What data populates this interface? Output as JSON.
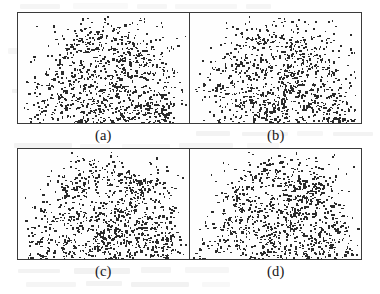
{
  "figure": {
    "kind": "four-panel-scatter-figure",
    "background_color": "#ffffff",
    "border_color": "#3a3a3a",
    "point_color": "#2b2b2b",
    "panels": [
      {
        "id": "panel-a",
        "caption": "(a)"
      },
      {
        "id": "panel-b",
        "caption": "(b)"
      },
      {
        "id": "panel-c",
        "caption": "(c)"
      },
      {
        "id": "panel-d",
        "caption": "(d)"
      }
    ],
    "captions": {
      "a": "(a)",
      "b": "(b)",
      "c": "(c)",
      "d": "(d)"
    }
  },
  "chart_data": {
    "type": "scatter",
    "title": "",
    "xlabel": "",
    "ylabel": "",
    "grid": false,
    "legend": null,
    "xlim": [
      0,
      1
    ],
    "ylim": [
      0,
      1
    ],
    "axis_ticks": {
      "x": [],
      "y": []
    },
    "panel_count": 4,
    "panel_layout": "2x2",
    "points_per_panel": 1100,
    "point_size_px": 1.3,
    "series": [
      {
        "name": "(a)",
        "n_points": 1100,
        "clusters": [
          {
            "cx": 0.17,
            "cy": 0.55,
            "sx": 0.085,
            "sy": 0.15,
            "n": 120,
            "label": "left sparse halo"
          },
          {
            "cx": 0.3,
            "cy": 0.42,
            "sx": 0.075,
            "sy": 0.17,
            "n": 130,
            "label": "left-mid band"
          },
          {
            "cx": 0.46,
            "cy": 0.55,
            "sx": 0.095,
            "sy": 0.2,
            "n": 230,
            "label": "dense core"
          },
          {
            "cx": 0.58,
            "cy": 0.7,
            "sx": 0.085,
            "sy": 0.15,
            "n": 180,
            "label": "lower-centre crowd"
          },
          {
            "cx": 0.62,
            "cy": 0.3,
            "sx": 0.105,
            "sy": 0.15,
            "n": 160,
            "label": "upper-centre branch"
          },
          {
            "cx": 0.78,
            "cy": 0.4,
            "sx": 0.09,
            "sy": 0.19,
            "n": 150,
            "label": "right arc"
          },
          {
            "cx": 0.86,
            "cy": 0.64,
            "sx": 0.065,
            "sy": 0.13,
            "n": 90,
            "label": "right-lower knot"
          },
          {
            "cx": 0.4,
            "cy": 0.14,
            "sx": 0.07,
            "sy": 0.06,
            "n": 40,
            "label": "top knot"
          }
        ]
      },
      {
        "name": "(b)",
        "n_points": 1100,
        "clusters": [
          {
            "cx": 0.17,
            "cy": 0.55,
            "sx": 0.085,
            "sy": 0.15,
            "n": 120,
            "label": "left sparse halo"
          },
          {
            "cx": 0.3,
            "cy": 0.42,
            "sx": 0.075,
            "sy": 0.17,
            "n": 130,
            "label": "left-mid band"
          },
          {
            "cx": 0.46,
            "cy": 0.55,
            "sx": 0.095,
            "sy": 0.2,
            "n": 230,
            "label": "dense core"
          },
          {
            "cx": 0.58,
            "cy": 0.7,
            "sx": 0.085,
            "sy": 0.15,
            "n": 180,
            "label": "lower-centre crowd"
          },
          {
            "cx": 0.62,
            "cy": 0.3,
            "sx": 0.105,
            "sy": 0.15,
            "n": 160,
            "label": "upper-centre branch"
          },
          {
            "cx": 0.78,
            "cy": 0.4,
            "sx": 0.09,
            "sy": 0.19,
            "n": 150,
            "label": "right arc"
          },
          {
            "cx": 0.86,
            "cy": 0.64,
            "sx": 0.065,
            "sy": 0.13,
            "n": 90,
            "label": "right-lower knot"
          },
          {
            "cx": 0.4,
            "cy": 0.14,
            "sx": 0.07,
            "sy": 0.06,
            "n": 40,
            "label": "top knot"
          }
        ]
      },
      {
        "name": "(c)",
        "n_points": 1100,
        "clusters": [
          {
            "cx": 0.17,
            "cy": 0.55,
            "sx": 0.085,
            "sy": 0.15,
            "n": 120,
            "label": "left sparse halo"
          },
          {
            "cx": 0.3,
            "cy": 0.42,
            "sx": 0.075,
            "sy": 0.17,
            "n": 130,
            "label": "left-mid band"
          },
          {
            "cx": 0.46,
            "cy": 0.55,
            "sx": 0.095,
            "sy": 0.2,
            "n": 230,
            "label": "dense core"
          },
          {
            "cx": 0.58,
            "cy": 0.7,
            "sx": 0.085,
            "sy": 0.15,
            "n": 180,
            "label": "lower-centre crowd"
          },
          {
            "cx": 0.62,
            "cy": 0.3,
            "sx": 0.105,
            "sy": 0.15,
            "n": 160,
            "label": "upper-centre branch"
          },
          {
            "cx": 0.78,
            "cy": 0.4,
            "sx": 0.09,
            "sy": 0.19,
            "n": 150,
            "label": "right arc"
          },
          {
            "cx": 0.86,
            "cy": 0.64,
            "sx": 0.065,
            "sy": 0.13,
            "n": 90,
            "label": "right-lower knot"
          },
          {
            "cx": 0.4,
            "cy": 0.14,
            "sx": 0.07,
            "sy": 0.06,
            "n": 40,
            "label": "top knot"
          }
        ]
      },
      {
        "name": "(d)",
        "n_points": 1100,
        "clusters": [
          {
            "cx": 0.17,
            "cy": 0.55,
            "sx": 0.085,
            "sy": 0.15,
            "n": 120,
            "label": "left sparse halo"
          },
          {
            "cx": 0.3,
            "cy": 0.42,
            "sx": 0.075,
            "sy": 0.17,
            "n": 130,
            "label": "left-mid band"
          },
          {
            "cx": 0.46,
            "cy": 0.55,
            "sx": 0.095,
            "sy": 0.2,
            "n": 230,
            "label": "dense core"
          },
          {
            "cx": 0.58,
            "cy": 0.7,
            "sx": 0.085,
            "sy": 0.15,
            "n": 180,
            "label": "lower-centre crowd"
          },
          {
            "cx": 0.62,
            "cy": 0.3,
            "sx": 0.105,
            "sy": 0.15,
            "n": 160,
            "label": "upper-centre branch"
          },
          {
            "cx": 0.78,
            "cy": 0.4,
            "sx": 0.09,
            "sy": 0.19,
            "n": 150,
            "label": "right arc"
          },
          {
            "cx": 0.86,
            "cy": 0.64,
            "sx": 0.065,
            "sy": 0.13,
            "n": 90,
            "label": "right-lower knot"
          },
          {
            "cx": 0.4,
            "cy": 0.14,
            "sx": 0.07,
            "sy": 0.06,
            "n": 40,
            "label": "top knot"
          }
        ]
      }
    ],
    "filaments": [
      {
        "x0": 0.33,
        "y0": 0.78,
        "x1": 0.72,
        "y1": 0.22,
        "n": 70,
        "jitter": 0.03,
        "label": "main diagonal chain"
      },
      {
        "x0": 0.44,
        "y0": 0.86,
        "x1": 0.88,
        "y1": 0.5,
        "n": 55,
        "jitter": 0.03,
        "label": "lower-right sweep"
      },
      {
        "x0": 0.24,
        "y0": 0.3,
        "x1": 0.52,
        "y1": 0.14,
        "n": 40,
        "jitter": 0.028,
        "label": "upper-left branch"
      },
      {
        "x0": 0.56,
        "y0": 0.18,
        "x1": 0.84,
        "y1": 0.36,
        "n": 45,
        "jitter": 0.028,
        "label": "upper-right branch"
      },
      {
        "x0": 0.12,
        "y0": 0.7,
        "x1": 0.4,
        "y1": 0.84,
        "n": 40,
        "jitter": 0.03,
        "label": "lower-left tail"
      },
      {
        "x0": 0.68,
        "y0": 0.52,
        "x1": 0.92,
        "y1": 0.7,
        "n": 35,
        "jitter": 0.026,
        "label": "right hook"
      }
    ]
  }
}
